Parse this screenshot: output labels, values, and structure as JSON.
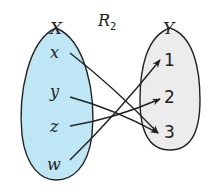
{
  "title_main": "R",
  "title_sub": "2",
  "sets": {
    "X": {
      "label": "X",
      "elements": [
        "x",
        "y",
        "z",
        "w"
      ],
      "fill": "#bfe6f4"
    },
    "Y": {
      "label": "Y",
      "elements": [
        "1",
        "2",
        "3"
      ],
      "fill": "#ececec"
    }
  },
  "relation": [
    {
      "from": "x",
      "to": "3"
    },
    {
      "from": "y",
      "to": "3"
    },
    {
      "from": "z",
      "to": "2"
    },
    {
      "from": "w",
      "to": "1"
    }
  ]
}
